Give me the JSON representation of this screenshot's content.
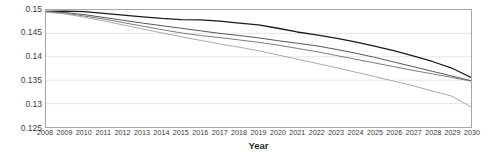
{
  "chart_data": {
    "type": "line",
    "title": "",
    "xlabel": "Year",
    "ylabel": "",
    "grid": true,
    "legend": "none",
    "x": [
      2008,
      2009,
      2010,
      2011,
      2012,
      2013,
      2014,
      2015,
      2016,
      2017,
      2018,
      2019,
      2020,
      2021,
      2022,
      2023,
      2024,
      2025,
      2026,
      2027,
      2028,
      2029,
      2030
    ],
    "categories": [
      "2008",
      "2009",
      "2010",
      "2011",
      "2012",
      "2013",
      "2014",
      "2015",
      "2016",
      "2017",
      "2018",
      "2019",
      "2020",
      "2021",
      "2022",
      "2023",
      "2024",
      "2025",
      "2026",
      "2027",
      "2028",
      "2029",
      "2030"
    ],
    "xlim": [
      2008,
      2030
    ],
    "ylim": [
      0.125,
      0.15
    ],
    "ytick_labels": [
      "0.15",
      "0.145",
      "0.14",
      "0.135",
      "0.13",
      "0.125"
    ],
    "ytick_values": [
      0.15,
      0.145,
      0.14,
      0.135,
      0.13,
      0.125
    ],
    "series": [
      {
        "name": "series-1",
        "color": "#1a1a1a",
        "width": 1.3,
        "values": [
          0.1497,
          0.14975,
          0.14965,
          0.1493,
          0.1489,
          0.14855,
          0.1482,
          0.14795,
          0.1479,
          0.1476,
          0.1472,
          0.1468,
          0.1461,
          0.1453,
          0.1447,
          0.144,
          0.1432,
          0.1423,
          0.1413,
          0.1402,
          0.139,
          0.1376,
          0.1356
        ]
      },
      {
        "name": "series-2",
        "color": "#555555",
        "width": 1.0,
        "values": [
          0.14965,
          0.14945,
          0.149,
          0.1484,
          0.1478,
          0.1472,
          0.14665,
          0.1461,
          0.14555,
          0.145,
          0.14455,
          0.14405,
          0.14345,
          0.1429,
          0.14235,
          0.1416,
          0.1408,
          0.1399,
          0.1389,
          0.1379,
          0.1369,
          0.1359,
          0.1349
        ]
      },
      {
        "name": "series-3",
        "color": "#7a7a7a",
        "width": 1.0,
        "values": [
          0.1496,
          0.1493,
          0.1487,
          0.14805,
          0.1473,
          0.14655,
          0.1458,
          0.1451,
          0.14455,
          0.1441,
          0.1436,
          0.1431,
          0.1425,
          0.1418,
          0.1411,
          0.1403,
          0.1395,
          0.1387,
          0.1379,
          0.1371,
          0.13635,
          0.1356,
          0.1348
        ]
      },
      {
        "name": "series-4",
        "color": "#a8a8a8",
        "width": 1.0,
        "values": [
          0.14955,
          0.14915,
          0.14845,
          0.14765,
          0.1468,
          0.14595,
          0.1451,
          0.1443,
          0.1435,
          0.14275,
          0.14205,
          0.1413,
          0.1404,
          0.1395,
          0.1386,
          0.1377,
          0.13675,
          0.1358,
          0.1348,
          0.1338,
          0.1327,
          0.1316,
          0.1293
        ]
      }
    ]
  }
}
